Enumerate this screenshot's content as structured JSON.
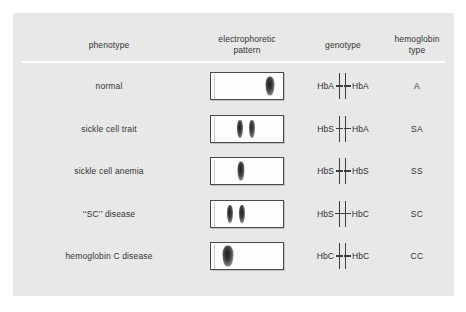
{
  "figure": {
    "panel_color": "#e8e8e8",
    "page_color": "#ffffff",
    "rule_color": "#ffffff"
  },
  "header": {
    "phenotype": "phenotype",
    "pattern_line1": "electrophoretic",
    "pattern_line2": "pattern",
    "genotype": "genotype",
    "hemoglobin_line1": "hemoglobin",
    "hemoglobin_line2": "type"
  },
  "rows": [
    {
      "phenotype": "normal",
      "genotype_left": "HbA",
      "genotype_right": "HbA",
      "hemoglobin_type": "A",
      "bands": [
        {
          "x_pct": 82,
          "width": 9,
          "height": 19,
          "opacity": 1.0
        }
      ]
    },
    {
      "phenotype": "sickle cell trait",
      "genotype_left": "HbS",
      "genotype_right": "HbA",
      "hemoglobin_type": "SA",
      "bands": [
        {
          "x_pct": 40,
          "width": 6,
          "height": 18,
          "opacity": 1.0
        },
        {
          "x_pct": 57,
          "width": 6,
          "height": 18,
          "opacity": 0.95
        }
      ]
    },
    {
      "phenotype": "sickle cell anemia",
      "genotype_left": "HbS",
      "genotype_right": "HbS",
      "hemoglobin_type": "SS",
      "bands": [
        {
          "x_pct": 42,
          "width": 7,
          "height": 19,
          "opacity": 1.0
        }
      ]
    },
    {
      "phenotype": "‘‘SC’’ disease",
      "genotype_left": "HbS",
      "genotype_right": "HbC",
      "hemoglobin_type": "SC",
      "bands": [
        {
          "x_pct": 26,
          "width": 6,
          "height": 18,
          "opacity": 1.0
        },
        {
          "x_pct": 43,
          "width": 6,
          "height": 18,
          "opacity": 1.0
        }
      ]
    },
    {
      "phenotype": "hemoglobin C disease",
      "genotype_left": "HbC",
      "genotype_right": "HbC",
      "hemoglobin_type": "CC",
      "bands": [
        {
          "x_pct": 24,
          "width": 11,
          "height": 21,
          "opacity": 1.0
        }
      ]
    }
  ]
}
